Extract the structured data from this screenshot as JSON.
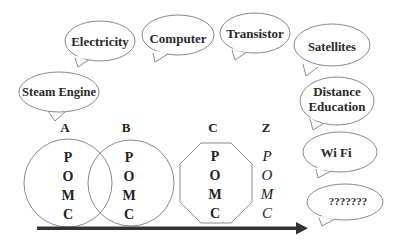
{
  "diagram": {
    "bubbles": [
      {
        "id": "steam-engine",
        "text": [
          "Steam Engine"
        ]
      },
      {
        "id": "electricity",
        "text": [
          "Electricity"
        ]
      },
      {
        "id": "computer",
        "text": [
          "Computer"
        ]
      },
      {
        "id": "transistor",
        "text": [
          "Transistor"
        ]
      },
      {
        "id": "satellites",
        "text": [
          "Satellites"
        ]
      },
      {
        "id": "distance-education",
        "text": [
          "Distance",
          "Education"
        ]
      },
      {
        "id": "wifi",
        "text": [
          "Wi Fi"
        ]
      },
      {
        "id": "unknown",
        "text": [
          "???????"
        ]
      }
    ],
    "stages": [
      {
        "label": "A",
        "shape": "circle",
        "letters": [
          "P",
          "O",
          "M",
          "C"
        ]
      },
      {
        "label": "B",
        "shape": "circle",
        "letters": [
          "P",
          "O",
          "M",
          "C"
        ]
      },
      {
        "label": "C",
        "shape": "octagon",
        "letters": [
          "P",
          "O",
          "M",
          "C"
        ]
      },
      {
        "label": "Z",
        "shape": "none",
        "letters": [
          "P",
          "O",
          "M",
          "C"
        ]
      }
    ],
    "arrow": {
      "direction": "right",
      "color": "#333333"
    }
  }
}
